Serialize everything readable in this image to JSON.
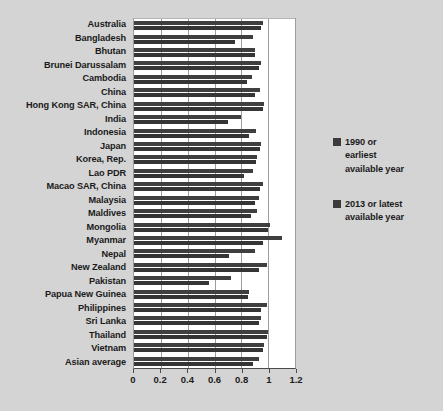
{
  "chart_data": {
    "type": "bar",
    "orientation": "horizontal",
    "title": "",
    "xlabel": "",
    "ylabel": "",
    "xlim": [
      0,
      1.2
    ],
    "xticks": [
      "0",
      "0.2",
      "0.4",
      "0.6",
      "0.8",
      "1",
      "1.2"
    ],
    "xtick_values": [
      0,
      0.2,
      0.4,
      0.6,
      0.8,
      1,
      1.2
    ],
    "grid": true,
    "legend_position": "right",
    "categories": [
      "Australia",
      "Bangladesh",
      "Bhutan",
      "Brunei Darussalam",
      "Cambodia",
      "China",
      "Hong Kong SAR, China",
      "India",
      "Indonesia",
      "Japan",
      "Korea, Rep.",
      "Lao PDR",
      "Macao SAR, China",
      "Malaysia",
      "Maldives",
      "Mongolia",
      "Myanmar",
      "Nepal",
      "New Zealand",
      "Pakistan",
      "Papua New Guinea",
      "Philippines",
      "Sri Lanka",
      "Thailand",
      "Vietnam",
      "Asian average"
    ],
    "series": [
      {
        "name": "1990 or earliest available year",
        "color": "#353535",
        "values": [
          0.95,
          0.75,
          0.9,
          0.93,
          0.84,
          0.9,
          0.96,
          0.7,
          0.86,
          0.94,
          0.91,
          0.82,
          0.94,
          0.9,
          0.87,
          1.0,
          0.96,
          0.71,
          0.93,
          0.56,
          0.85,
          0.95,
          0.93,
          0.99,
          0.96,
          0.89
        ]
      },
      {
        "name": "2013 or latest available year",
        "color": "#3f3f3f",
        "values": [
          0.96,
          0.89,
          0.9,
          0.95,
          0.88,
          0.94,
          0.97,
          0.8,
          0.91,
          0.95,
          0.92,
          0.89,
          0.96,
          0.93,
          0.92,
          1.01,
          1.1,
          0.9,
          0.99,
          0.72,
          0.86,
          0.99,
          0.95,
          1.0,
          0.97,
          0.93
        ]
      }
    ]
  },
  "legend": {
    "entries": [
      {
        "label_line1": "1990 or",
        "label_line2": "earliest",
        "label_line3": "available year",
        "color": "#3b3b3b"
      },
      {
        "label_line1": "2013 or latest",
        "label_line2": "available year",
        "label_line3": "",
        "color": "#3b3b3b"
      }
    ]
  }
}
